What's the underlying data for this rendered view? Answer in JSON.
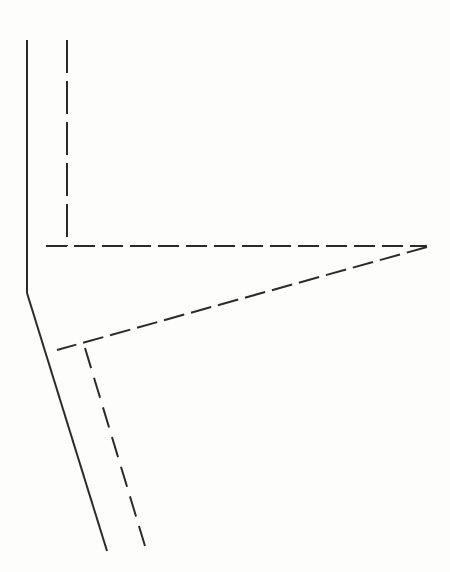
{
  "figure": {
    "canvas": {
      "width": 450,
      "height": 572
    },
    "background_color": "#fdfdfc",
    "ink_color": "#2b2b2b",
    "stroke_width": 2
  },
  "chart_data": {
    "type": "line",
    "xlabel": "",
    "ylabel": "",
    "xlim": [
      0,
      450
    ],
    "ylim": [
      0,
      572
    ],
    "grid": false,
    "legend": "none",
    "series": [
      {
        "name": "solid-upper-vertical",
        "style": "solid",
        "color": "#2b2b2b",
        "width": 2,
        "points": [
          [
            27,
            40
          ],
          [
            27,
            293
          ]
        ]
      },
      {
        "name": "solid-lower-diagonal",
        "style": "solid",
        "color": "#2b2b2b",
        "width": 2,
        "points": [
          [
            27,
            293
          ],
          [
            107,
            551
          ]
        ]
      },
      {
        "name": "dashed-upper-vertical",
        "style": "dashed",
        "color": "#2b2b2b",
        "width": 2,
        "dash": "33 8",
        "points": [
          [
            67,
            40
          ],
          [
            67,
            246
          ]
        ]
      },
      {
        "name": "dashed-horizontal",
        "style": "dashed",
        "color": "#2b2b2b",
        "width": 2,
        "dash": "21 7",
        "points": [
          [
            46,
            246
          ],
          [
            427,
            246
          ]
        ]
      },
      {
        "name": "dashed-apex-diagonal",
        "style": "dashed",
        "color": "#2b2b2b",
        "width": 2,
        "dash": "21 7",
        "points": [
          [
            427,
            247
          ],
          [
            57,
            350
          ]
        ]
      },
      {
        "name": "dashed-lower-descending",
        "style": "dashed",
        "color": "#2b2b2b",
        "width": 2,
        "dash": "21 10",
        "points": [
          [
            85,
            348
          ],
          [
            145,
            546
          ]
        ]
      }
    ],
    "vertices": [
      {
        "name": "solid-top",
        "x": 27,
        "y": 40
      },
      {
        "name": "solid-bend",
        "x": 27,
        "y": 293
      },
      {
        "name": "solid-bottom",
        "x": 107,
        "y": 551
      },
      {
        "name": "dashed-top",
        "x": 67,
        "y": 40
      },
      {
        "name": "horizontal-left-end",
        "x": 46,
        "y": 246
      },
      {
        "name": "apex",
        "x": 427,
        "y": 246
      },
      {
        "name": "lower-branch-left-end",
        "x": 57,
        "y": 350
      },
      {
        "name": "lower-branch-node",
        "x": 85,
        "y": 348
      },
      {
        "name": "dashed-bottom",
        "x": 145,
        "y": 546
      }
    ]
  }
}
